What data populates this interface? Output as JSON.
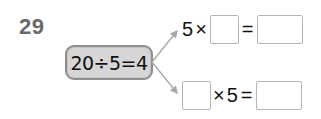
{
  "problem": {
    "number": "29",
    "given_equation": "20÷5=4",
    "top_row": {
      "left_operand": "5",
      "operator": "×",
      "equals": "=",
      "blank_1": "",
      "blank_2": ""
    },
    "bottom_row": {
      "blank_1": "",
      "operator": "×",
      "right_operand": "5",
      "equals": "=",
      "blank_2": ""
    }
  },
  "colors": {
    "pill_fill": "#d6d6d6",
    "pill_border": "#8f8f8f",
    "arrow": "#a8a8a8",
    "number": "#6a6a6a"
  }
}
